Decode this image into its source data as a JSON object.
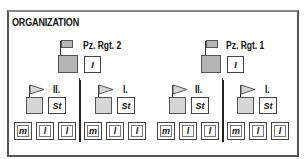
{
  "title": "ORGANIZATION",
  "colors": {
    "frame": "#555555",
    "regiment_hq_fill": "#b5b5b5",
    "battalion_hq_fill": "#d6d6d6",
    "box_border": "#444444",
    "divider": "#222222"
  },
  "regiments": [
    {
      "label": "Pz. Rgt. 2",
      "hq_icon": "flag-rect-icon",
      "staff_box": "I",
      "battalions": [
        {
          "label": "II.",
          "staff_box": "St",
          "companies": [
            "m",
            "l",
            "l"
          ]
        },
        {
          "label": "I.",
          "staff_box": "St",
          "companies": [
            "m",
            "l",
            "l"
          ]
        }
      ]
    },
    {
      "label": "Pz. Rgt. 1",
      "hq_icon": "flag-rect-icon",
      "staff_box": "I",
      "battalions": [
        {
          "label": "II.",
          "staff_box": "St",
          "companies": [
            "m",
            "l",
            "l"
          ]
        },
        {
          "label": "I.",
          "staff_box": "St",
          "companies": [
            "m",
            "l",
            "l"
          ]
        }
      ]
    }
  ]
}
